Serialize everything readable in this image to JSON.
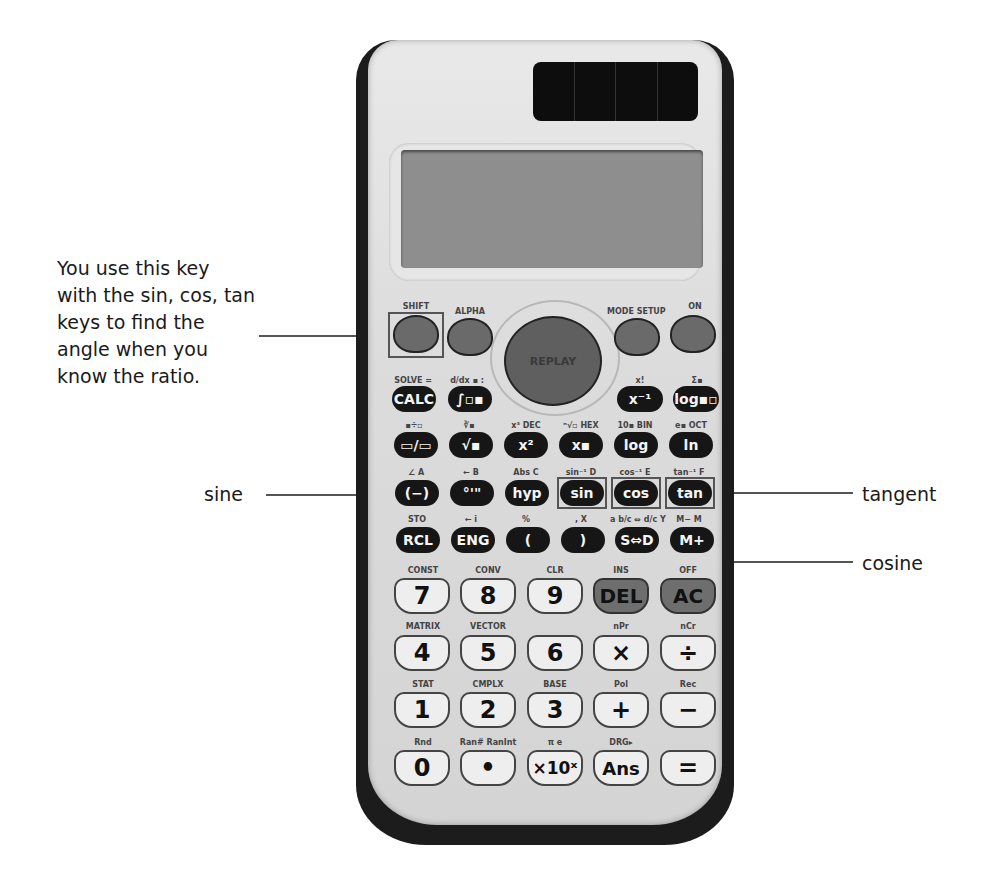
{
  "annotations": {
    "shift_note": "You use this key\nwith the sin, cos, tan\nkeys to find the\nangle when you\nknow the ratio.",
    "sine": "sine",
    "tangent": "tangent",
    "cosine": "cosine"
  },
  "calculator": {
    "dpad_label": "REPLAY",
    "top_row": {
      "shift": "SHIFT",
      "alpha": "ALPHA",
      "mode": "MODE SETUP",
      "on": "ON"
    },
    "row1": {
      "labels": [
        "SOLVE =",
        "d/dx ▪ :",
        "x!",
        "Σ▪"
      ],
      "keys": [
        "CALC",
        "∫▫▪",
        "x⁻¹",
        "log▪▫"
      ]
    },
    "row2": {
      "labels": [
        "▪÷▫",
        "∛▪",
        "x³ DEC",
        "ⁿ√▫ HEX",
        "10▪ BIN",
        "e▪ OCT"
      ],
      "keys": [
        "▭/▭",
        "√▪",
        "x²",
        "x▪",
        "log",
        "ln"
      ]
    },
    "row3": {
      "labels": [
        "∠ A",
        "← B",
        "Abs C",
        "sin⁻¹ D",
        "cos⁻¹ E",
        "tan⁻¹ F"
      ],
      "keys": [
        "(−)",
        "°'\"",
        "hyp",
        "sin",
        "cos",
        "tan"
      ]
    },
    "row4": {
      "labels": [
        "STO",
        "← i",
        "%",
        ", X",
        "a b/c ⇔ d/c Y",
        "M− M"
      ],
      "keys": [
        "RCL",
        "ENG",
        "(",
        ")",
        "S⇔D",
        "M+"
      ]
    },
    "row5": {
      "labels": [
        "CONST",
        "CONV",
        "CLR",
        "INS",
        "OFF"
      ],
      "keys": [
        "7",
        "8",
        "9",
        "DEL",
        "AC"
      ]
    },
    "row6": {
      "labels": [
        "MATRIX",
        "VECTOR",
        "",
        "nPr",
        "nCr"
      ],
      "keys": [
        "4",
        "5",
        "6",
        "×",
        "÷"
      ]
    },
    "row7": {
      "labels": [
        "STAT",
        "CMPLX",
        "BASE",
        "Pol",
        "Rec"
      ],
      "keys": [
        "1",
        "2",
        "3",
        "+",
        "−"
      ]
    },
    "row8": {
      "labels": [
        "Rnd",
        "Ran# RanInt",
        "π    e",
        "DRG▸",
        ""
      ],
      "keys": [
        "0",
        "•",
        "×10ˣ",
        "Ans",
        "="
      ]
    }
  }
}
